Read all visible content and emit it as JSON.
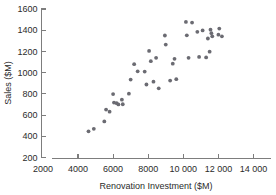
{
  "chart_data": {
    "type": "scatter",
    "title": "",
    "xlabel": "Renovation Investment ($M)",
    "ylabel": "Sales ($M)",
    "xlim": [
      2000,
      14000
    ],
    "ylim": [
      200,
      1600
    ],
    "grid": false,
    "legend": null,
    "xticks": [
      2000,
      4000,
      6000,
      8000,
      10000,
      12000,
      14000
    ],
    "xtick_labels": [
      "2000",
      "4000",
      "6000",
      "8000",
      "10 000",
      "12 000",
      "14 000"
    ],
    "yticks": [
      200,
      400,
      600,
      800,
      1000,
      1200,
      1400,
      1600
    ],
    "ytick_labels": [
      "200",
      "400",
      "600",
      "800",
      "1000",
      "1200",
      "1400",
      "1600"
    ],
    "marker": "circle",
    "marker_color": "#6b6b72",
    "points": [
      {
        "x": 4600,
        "y": 447
      },
      {
        "x": 4900,
        "y": 470
      },
      {
        "x": 5500,
        "y": 540
      },
      {
        "x": 5600,
        "y": 652
      },
      {
        "x": 5800,
        "y": 632
      },
      {
        "x": 6000,
        "y": 798
      },
      {
        "x": 6050,
        "y": 718
      },
      {
        "x": 6200,
        "y": 712
      },
      {
        "x": 6300,
        "y": 700
      },
      {
        "x": 6500,
        "y": 745
      },
      {
        "x": 6550,
        "y": 702
      },
      {
        "x": 6900,
        "y": 802
      },
      {
        "x": 7000,
        "y": 935
      },
      {
        "x": 7200,
        "y": 1080
      },
      {
        "x": 7400,
        "y": 1012
      },
      {
        "x": 7800,
        "y": 1010
      },
      {
        "x": 7900,
        "y": 888
      },
      {
        "x": 8050,
        "y": 1205
      },
      {
        "x": 8150,
        "y": 1108
      },
      {
        "x": 8300,
        "y": 915
      },
      {
        "x": 8450,
        "y": 1140
      },
      {
        "x": 8600,
        "y": 852
      },
      {
        "x": 8950,
        "y": 1350
      },
      {
        "x": 9000,
        "y": 1265
      },
      {
        "x": 9250,
        "y": 925
      },
      {
        "x": 9400,
        "y": 1085
      },
      {
        "x": 9500,
        "y": 1130
      },
      {
        "x": 9600,
        "y": 938
      },
      {
        "x": 10150,
        "y": 1478
      },
      {
        "x": 10200,
        "y": 1352
      },
      {
        "x": 10300,
        "y": 1140
      },
      {
        "x": 10500,
        "y": 1472
      },
      {
        "x": 10800,
        "y": 1385
      },
      {
        "x": 10900,
        "y": 1148
      },
      {
        "x": 11100,
        "y": 1398
      },
      {
        "x": 11300,
        "y": 1143
      },
      {
        "x": 11400,
        "y": 1322
      },
      {
        "x": 11500,
        "y": 1198
      },
      {
        "x": 11550,
        "y": 1405
      },
      {
        "x": 11600,
        "y": 1372
      },
      {
        "x": 11650,
        "y": 1342
      },
      {
        "x": 12000,
        "y": 1358
      },
      {
        "x": 12050,
        "y": 1415
      },
      {
        "x": 12200,
        "y": 1342
      }
    ]
  },
  "axis": {
    "x_title": "Renovation Investment ($M)",
    "y_title": "Sales ($M)"
  }
}
